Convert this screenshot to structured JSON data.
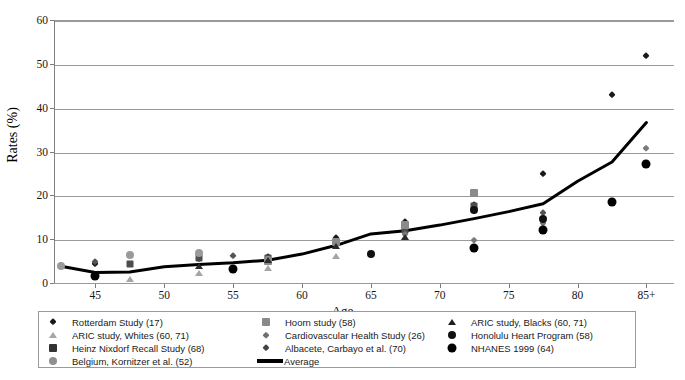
{
  "chart_data": {
    "type": "scatter",
    "title": "",
    "xlabel": "Age",
    "ylabel": "Rates (%)",
    "xlim": [
      42,
      87
    ],
    "ylim": [
      0,
      60
    ],
    "grid": true,
    "legend_position": "bottom",
    "yticks": [
      0,
      10,
      20,
      30,
      40,
      50,
      60
    ],
    "xticks": [
      "45",
      "50",
      "55",
      "60",
      "65",
      "70",
      "75",
      "80",
      "85+"
    ],
    "xtick_values": [
      45,
      50,
      55,
      60,
      65,
      70,
      75,
      80,
      85
    ],
    "series": [
      {
        "name": "Rotterdam Study (17)",
        "marker": "diamond",
        "color": "#1a1a1a",
        "size": 7,
        "points": [
          [
            45,
            4.3
          ],
          [
            52.5,
            5.5
          ],
          [
            57.5,
            6.0
          ],
          [
            62.5,
            10.2
          ],
          [
            67.5,
            14.0
          ],
          [
            72.5,
            17.8
          ],
          [
            77.5,
            24.8
          ],
          [
            82.5,
            43.0
          ],
          [
            85,
            51.8
          ]
        ]
      },
      {
        "name": "ARIC study, Whites (60, 71)",
        "marker": "triangle",
        "color": "#a5a5a5",
        "size": 8,
        "points": [
          [
            47.5,
            1.0
          ],
          [
            52.5,
            2.3
          ],
          [
            57.5,
            3.4
          ],
          [
            62.5,
            6.2
          ],
          [
            67.5,
            10.5
          ]
        ]
      },
      {
        "name": "Heinz Nixdorf Recall Study (68)",
        "marker": "square",
        "color": "#4d4d4d",
        "size": 7,
        "points": [
          [
            47.5,
            4.4
          ],
          [
            52.5,
            5.6
          ],
          [
            57.5,
            5.8
          ],
          [
            62.5,
            9.3
          ],
          [
            67.5,
            12.2
          ],
          [
            72.5,
            17.6
          ]
        ]
      },
      {
        "name": "Belgium, Kornitzer et al. (52)",
        "marker": "circle",
        "color": "#9a9a9a",
        "size": 8,
        "points": [
          [
            42.5,
            3.9
          ],
          [
            47.5,
            6.4
          ],
          [
            52.5,
            6.8
          ],
          [
            57.5,
            5.2
          ]
        ]
      },
      {
        "name": "Hoorn study (58)",
        "marker": "square",
        "color": "#8a8a8a",
        "size": 8,
        "points": [
          [
            57.5,
            5.1
          ],
          [
            62.5,
            9.3
          ],
          [
            67.5,
            13.2
          ],
          [
            72.5,
            20.6
          ]
        ]
      },
      {
        "name": "Cardiovascular Health Study (26)",
        "marker": "diamond",
        "color": "#7a7a7a",
        "size": 6,
        "points": [
          [
            67.5,
            11.2
          ],
          [
            72.5,
            9.9
          ],
          [
            77.5,
            13.8
          ],
          [
            85,
            30.9
          ]
        ]
      },
      {
        "name": "Albacete, Carbayo et al. (70)",
        "marker": "diamond",
        "color": "#555555",
        "size": 7,
        "points": [
          [
            45,
            4.8
          ],
          [
            55,
            6.2
          ],
          [
            72.5,
            17.1
          ],
          [
            77.5,
            16.0
          ]
        ]
      },
      {
        "name": "ARIC study, Blacks (60, 71)",
        "marker": "triangle",
        "color": "#2b2b2b",
        "size": 8,
        "points": [
          [
            52.5,
            3.8
          ],
          [
            57.5,
            5.3
          ],
          [
            62.5,
            8.5
          ],
          [
            67.5,
            10.6
          ]
        ]
      },
      {
        "name": "Honolulu Heart Program (58)",
        "marker": "circle",
        "color": "#111111",
        "size": 8,
        "points": [
          [
            65,
            6.7
          ],
          [
            72.5,
            16.6
          ],
          [
            77.5,
            14.5
          ]
        ]
      },
      {
        "name": "NHANES 1999 (64)",
        "marker": "circle",
        "color": "#000000",
        "size": 9,
        "points": [
          [
            45,
            1.6
          ],
          [
            55,
            3.2
          ],
          [
            72.5,
            8.0
          ],
          [
            77.5,
            12.2
          ],
          [
            82.5,
            18.4
          ],
          [
            85,
            27.1
          ]
        ]
      }
    ],
    "average_line": {
      "name": "Average",
      "color": "#000000",
      "width": 3,
      "points": [
        [
          42.5,
          3.8
        ],
        [
          45,
          2.4
        ],
        [
          47.5,
          2.5
        ],
        [
          50,
          3.7
        ],
        [
          52.5,
          4.2
        ],
        [
          55,
          4.6
        ],
        [
          57.5,
          5.2
        ],
        [
          60,
          6.6
        ],
        [
          62.5,
          8.6
        ],
        [
          65,
          11.2
        ],
        [
          67.5,
          11.9
        ],
        [
          70,
          13.2
        ],
        [
          72.5,
          14.7
        ],
        [
          75,
          16.3
        ],
        [
          77.5,
          18.1
        ],
        [
          80,
          23.2
        ],
        [
          82.5,
          27.6
        ],
        [
          85,
          36.6
        ]
      ]
    }
  },
  "legend": {
    "columns": [
      {
        "items": [
          {
            "label": "Rotterdam Study (17)",
            "marker": "diamond",
            "color": "#1a1a1a",
            "size": 7
          },
          {
            "label": "ARIC study, Whites (60, 71)",
            "marker": "triangle",
            "color": "#a5a5a5",
            "size": 8
          },
          {
            "label": "Heinz Nixdorf Recall Study (68)",
            "marker": "square",
            "color": "#333333",
            "size": 8
          },
          {
            "label": "Belgium, Kornitzer et al. (52)",
            "marker": "circle",
            "color": "#8f8f8f",
            "size": 8
          }
        ]
      },
      {
        "items": [
          {
            "label": "Hoorn study (58)",
            "marker": "square",
            "color": "#8a8a8a",
            "size": 8
          },
          {
            "label": "Cardiovascular Health Study (26)",
            "marker": "diamond",
            "color": "#6f6f6f",
            "size": 6
          },
          {
            "label": "Albacete, Carbayo et al. (70)",
            "marker": "diamond",
            "color": "#444444",
            "size": 7
          },
          {
            "label": "Average",
            "marker": "line",
            "color": "#000000",
            "size": 4
          }
        ]
      },
      {
        "items": [
          {
            "label": "ARIC study, Blacks (60, 71)",
            "marker": "triangle",
            "color": "#1f1f1f",
            "size": 8
          },
          {
            "label": "Honolulu Heart Program (58)",
            "marker": "circle",
            "color": "#111111",
            "size": 8
          },
          {
            "label": "NHANES 1999 (64)",
            "marker": "circle",
            "color": "#000000",
            "size": 9
          }
        ]
      }
    ]
  }
}
